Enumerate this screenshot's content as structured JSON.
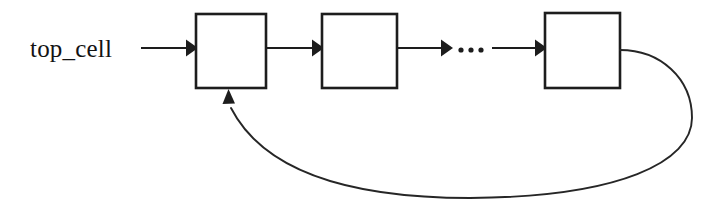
{
  "diagram": {
    "background_color": "#ffffff",
    "stroke_color": "#1d1d1d",
    "label": {
      "text": "top_cell",
      "x": 30,
      "y": 57
    },
    "ellipsis": {
      "text": "...",
      "x": 457,
      "y": 50
    },
    "boxes": [
      {
        "name": "cell-box-first",
        "label": "",
        "x": 196,
        "y": 14,
        "width": 70,
        "height": 74
      },
      {
        "name": "cell-box-second",
        "label": "",
        "x": 322,
        "y": 14,
        "width": 75,
        "height": 74
      },
      {
        "name": "cell-box-last",
        "label": "",
        "x": 545,
        "y": 13,
        "width": 75,
        "height": 75
      }
    ],
    "arrows": [
      {
        "name": "arrow-label-to-first",
        "from_x": 141,
        "to_x": 196,
        "y": 48
      },
      {
        "name": "arrow-first-to-second",
        "from_x": 266,
        "to_x": 322,
        "y": 48
      },
      {
        "name": "arrow-second-to-ellipsis",
        "from_x": 397,
        "to_x": 452,
        "y": 48
      },
      {
        "name": "arrow-ellipsis-to-last",
        "from_x": 490,
        "to_x": 545,
        "y": 48
      }
    ],
    "feedback": {
      "name": "feedback-loop-arrow",
      "start_x": 620,
      "start_y": 50,
      "end_x": 228,
      "end_y": 90,
      "max_right_x": 692,
      "max_bottom_y": 197
    }
  }
}
